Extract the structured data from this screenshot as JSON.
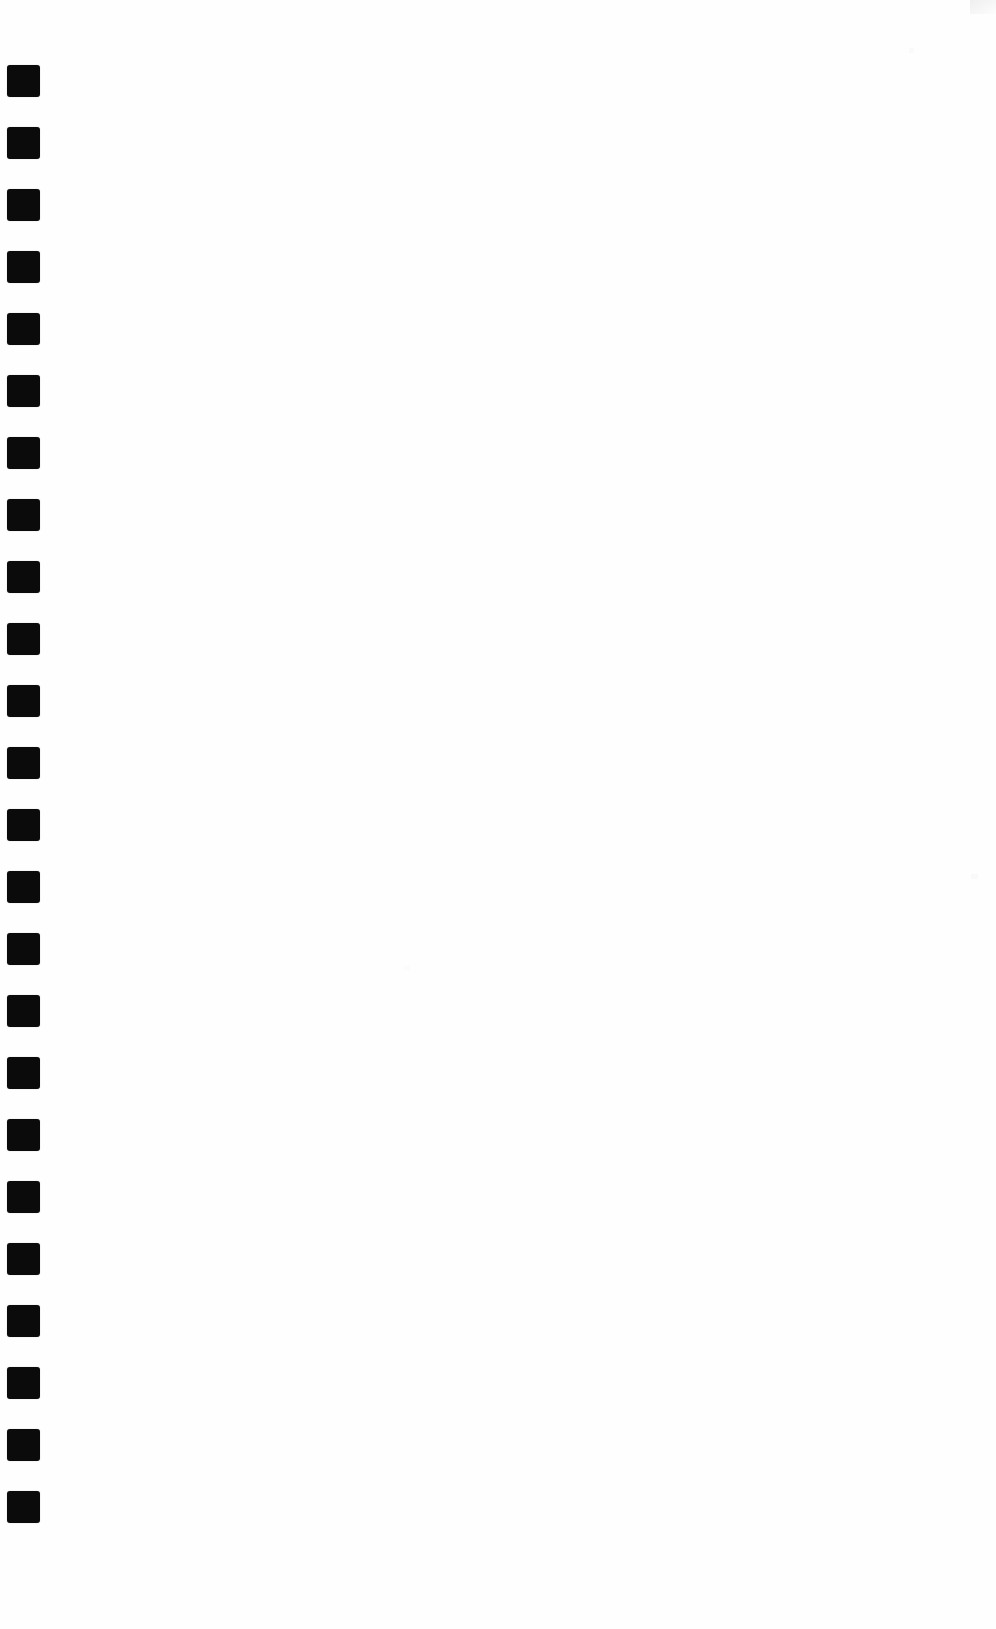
{
  "page": {
    "width": 996,
    "height": 1629,
    "background_color": "#fefefe",
    "body_text": ""
  },
  "marker_strip": {
    "name": "left-margin-marker-strip",
    "description": "Vertical column of solid black rounded squares along the left margin",
    "marker_color": "#0b0b0b",
    "marker_width": 33,
    "marker_height": 32,
    "corner_radius": 3,
    "left_offset": 7,
    "first_top": 65,
    "pitch": 62,
    "count": 24,
    "markers": [
      {
        "index": 1,
        "top": 65,
        "left": 7
      },
      {
        "index": 2,
        "top": 127,
        "left": 7
      },
      {
        "index": 3,
        "top": 189,
        "left": 7
      },
      {
        "index": 4,
        "top": 251,
        "left": 7
      },
      {
        "index": 5,
        "top": 313,
        "left": 7
      },
      {
        "index": 6,
        "top": 375,
        "left": 7
      },
      {
        "index": 7,
        "top": 437,
        "left": 7
      },
      {
        "index": 8,
        "top": 499,
        "left": 7
      },
      {
        "index": 9,
        "top": 561,
        "left": 7
      },
      {
        "index": 10,
        "top": 623,
        "left": 7
      },
      {
        "index": 11,
        "top": 685,
        "left": 7
      },
      {
        "index": 12,
        "top": 747,
        "left": 7
      },
      {
        "index": 13,
        "top": 809,
        "left": 7
      },
      {
        "index": 14,
        "top": 871,
        "left": 7
      },
      {
        "index": 15,
        "top": 933,
        "left": 7
      },
      {
        "index": 16,
        "top": 995,
        "left": 7
      },
      {
        "index": 17,
        "top": 1057,
        "left": 7
      },
      {
        "index": 18,
        "top": 1119,
        "left": 7
      },
      {
        "index": 19,
        "top": 1181,
        "left": 7
      },
      {
        "index": 20,
        "top": 1243,
        "left": 7
      },
      {
        "index": 21,
        "top": 1305,
        "left": 7
      },
      {
        "index": 22,
        "top": 1367,
        "left": 7
      },
      {
        "index": 23,
        "top": 1429,
        "left": 7
      },
      {
        "index": 24,
        "top": 1491,
        "left": 7
      }
    ]
  },
  "artifacts": {
    "smudge_color": "#f2f2f2",
    "items": [
      {
        "name": "smudge-topright"
      },
      {
        "name": "smudge-midright"
      },
      {
        "name": "smudge-upperright"
      },
      {
        "name": "smudge-center"
      }
    ]
  }
}
